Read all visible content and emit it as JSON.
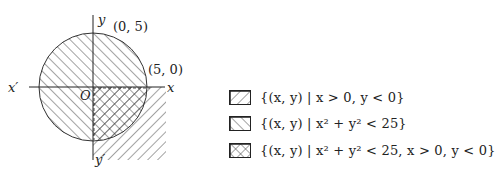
{
  "diagram": {
    "axes": {
      "x_label": "x",
      "x_neg_label": "x′",
      "y_label": "y",
      "y_neg_label": "y′",
      "origin_label": "O"
    },
    "points": [
      {
        "label": "(0, 5)"
      },
      {
        "label": "(5, 0)"
      }
    ],
    "circle": {
      "equation": "x² + y² = 25",
      "radius": 5
    }
  },
  "legend": {
    "items": [
      {
        "pattern": "forward-hatch",
        "text": "{(x, y) | x > 0,    y < 0}"
      },
      {
        "pattern": "back-hatch",
        "text": "{(x, y) | x² + y² < 25}"
      },
      {
        "pattern": "cross-hatch",
        "text": "{(x, y) | x² + y² < 25,    x > 0,    y < 0}"
      }
    ]
  }
}
